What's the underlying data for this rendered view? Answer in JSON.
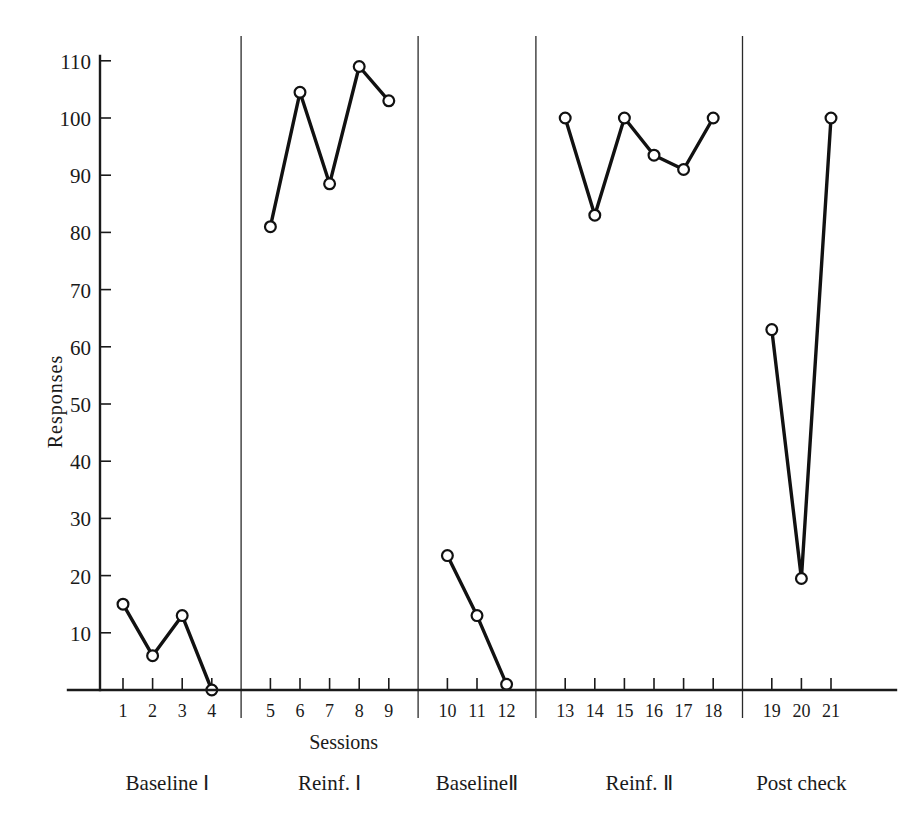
{
  "chart_data": {
    "type": "line",
    "title": "",
    "xlabel": "Sessions",
    "ylabel": "Responses",
    "xlim": [
      0.4,
      21.6
    ],
    "ylim": [
      0,
      115
    ],
    "grid": false,
    "legend": "none",
    "x": [
      1,
      2,
      3,
      4,
      5,
      6,
      7,
      8,
      9,
      10,
      11,
      12,
      13,
      14,
      15,
      16,
      17,
      18,
      19,
      20,
      21
    ],
    "xticklabels": [
      "1",
      "2",
      "3",
      "4",
      "5",
      "6",
      "7",
      "8",
      "9",
      "10",
      "11",
      "12",
      "13",
      "14",
      "15",
      "16",
      "17",
      "18",
      "19",
      "20",
      "21"
    ],
    "yticks": [
      10,
      20,
      30,
      40,
      50,
      60,
      70,
      80,
      90,
      100,
      110
    ],
    "yticklabels": [
      "10",
      "20",
      "30",
      "40",
      "50",
      "60",
      "70",
      "80",
      "90",
      "100",
      "110"
    ],
    "phases": [
      {
        "name": "Baseline I",
        "label": "Baseline Ⅰ",
        "x_start": 1,
        "x_end": 4,
        "values": [
          15,
          6,
          13,
          0
        ]
      },
      {
        "name": "Reinf. I",
        "label": "Reinf. Ⅰ",
        "x_start": 5,
        "x_end": 9,
        "values": [
          81,
          104.5,
          88.5,
          109,
          103
        ]
      },
      {
        "name": "Baseline II",
        "label": "BaselineⅡ",
        "x_start": 10,
        "x_end": 12,
        "values": [
          23.5,
          13,
          1
        ]
      },
      {
        "name": "Reinf. II",
        "label": "Reinf. Ⅱ",
        "x_start": 13,
        "x_end": 18,
        "values": [
          100,
          83,
          100,
          93.5,
          91,
          100
        ]
      },
      {
        "name": "Post check",
        "label": "Post check",
        "x_start": 19,
        "x_end": 21,
        "values": [
          63,
          19.5,
          100
        ]
      }
    ],
    "series": [
      {
        "name": "Responses",
        "values": [
          15,
          6,
          13,
          0,
          81,
          104.5,
          88.5,
          109,
          103,
          23.5,
          13,
          1,
          100,
          83,
          100,
          93.5,
          91,
          100,
          63,
          19.5,
          100
        ]
      }
    ],
    "marker": "open-circle",
    "line_color": "#111111",
    "marker_face_color": "#ffffff"
  },
  "axis": {
    "y_title": "Responses",
    "x_title": "Sessions"
  }
}
